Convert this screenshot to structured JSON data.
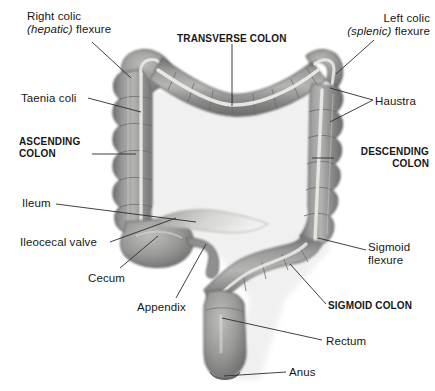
{
  "figure": {
    "style": "grayscale medical illustration",
    "background_color": "#ffffff",
    "organ_color": "#8d8d8d",
    "organ_highlight_color": "#e8e8e4",
    "leader_line_color": "#2b2b2b",
    "text_color": "#171717"
  },
  "labels": [
    {
      "id": "right-colic-flexure",
      "line1": "Right colic",
      "line2_italic": "(hepatic)",
      "line2_rest": " flexure",
      "emphasis": "normal",
      "align": "left",
      "x": 27,
      "y": 10
    },
    {
      "id": "transverse-colon",
      "text": "TRANSVERSE COLON",
      "emphasis": "bold",
      "align": "left",
      "x": 177,
      "y": 33
    },
    {
      "id": "left-colic-flexure",
      "line1": "Left colic",
      "line2_italic": "(splenic)",
      "line2_rest": " flexure",
      "emphasis": "normal",
      "align": "right",
      "x": 318,
      "y": 12
    },
    {
      "id": "taenia-coli",
      "text": "Taenia coli",
      "emphasis": "normal",
      "align": "left",
      "x": 21,
      "y": 92
    },
    {
      "id": "haustra",
      "text": "Haustra",
      "emphasis": "normal",
      "align": "left",
      "x": 375,
      "y": 95
    },
    {
      "id": "ascending-colon",
      "line1": "ASCENDING",
      "line2": "COLON",
      "emphasis": "bold",
      "align": "left",
      "x": 19,
      "y": 136
    },
    {
      "id": "descending-colon",
      "line1": "DESCENDING",
      "line2": "COLON",
      "emphasis": "bold",
      "align": "right",
      "x": 337,
      "y": 146
    },
    {
      "id": "ileum",
      "text": "Ileum",
      "emphasis": "normal",
      "align": "left",
      "x": 22,
      "y": 197
    },
    {
      "id": "ileocecal-valve",
      "text": "Ileocecal valve",
      "emphasis": "normal",
      "align": "left",
      "x": 20,
      "y": 236
    },
    {
      "id": "sigmoid-flexure",
      "line1": "Sigmoid",
      "line2": "flexure",
      "emphasis": "normal",
      "align": "left",
      "x": 368,
      "y": 241
    },
    {
      "id": "cecum",
      "text": "Cecum",
      "emphasis": "normal",
      "align": "left",
      "x": 88,
      "y": 272
    },
    {
      "id": "sigmoid-colon",
      "text": "SIGMOID COLON",
      "emphasis": "bold",
      "align": "left",
      "x": 328,
      "y": 300
    },
    {
      "id": "appendix",
      "text": "Appendix",
      "emphasis": "normal",
      "align": "left",
      "x": 137,
      "y": 301
    },
    {
      "id": "rectum",
      "text": "Rectum",
      "emphasis": "normal",
      "align": "left",
      "x": 326,
      "y": 335
    },
    {
      "id": "anus",
      "text": "Anus",
      "emphasis": "normal",
      "align": "left",
      "x": 289,
      "y": 366
    }
  ]
}
